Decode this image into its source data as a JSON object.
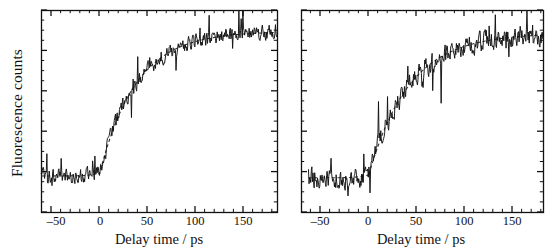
{
  "figure": {
    "title": "",
    "background_color": "#ffffff",
    "ink_color": "#111111",
    "panel_count": 2
  },
  "chart_data": [
    {
      "type": "line",
      "panel": "left",
      "title": "",
      "xlabel": "Delay time / ps",
      "ylabel": "Fluorescence counts",
      "xlim": [
        -65,
        185
      ],
      "ylim": [
        0,
        1.12
      ],
      "xticks": [
        -50,
        0,
        50,
        100,
        150
      ],
      "xticklabels": [
        "–50",
        "0",
        "50",
        "100",
        "150"
      ],
      "xminortick_step": 10,
      "yticklabels": [],
      "yticks_unlabeled": true,
      "grid": false,
      "legend": null,
      "series": [
        {
          "name": "fluorescence rise (data)",
          "style": "solid-noisy",
          "color": "#111111",
          "description": "noisy fluorescence transient: flat baseline before t=0, sigmoidal rise from 0 to ~110 ps, noisy plateau thereafter",
          "noise_amplitude": 0.055,
          "baseline": 0.16,
          "plateau": 0.93,
          "t_zero": 0,
          "rise_time_ps": 38
        },
        {
          "name": "exponential fit",
          "style": "dashed",
          "color": "#222222",
          "description": "smooth single-exponential rise convoluted with instrument response",
          "baseline": 0.16,
          "plateau": 0.93,
          "t_zero": 0,
          "rise_time_ps": 38
        }
      ]
    },
    {
      "type": "line",
      "panel": "right",
      "title": "",
      "xlabel": "Delay time / ps",
      "ylabel": "",
      "xlim": [
        -62,
        185
      ],
      "ylim": [
        0,
        1.12
      ],
      "xticks": [
        -50,
        0,
        50,
        100,
        150
      ],
      "xticklabels": [
        "–50",
        "0",
        "50",
        "100",
        "150"
      ],
      "xminortick_step": 10,
      "yticklabels": [],
      "yticks_unlabeled": true,
      "grid": false,
      "legend": null,
      "series": [
        {
          "name": "fluorescence rise (data)",
          "style": "solid-noisy",
          "color": "#111111",
          "description": "noisy fluorescence transient with larger scatter: flat baseline before t=0, sigmoidal rise to ~110 ps, noisy plateau",
          "noise_amplitude": 0.075,
          "baseline": 0.15,
          "plateau": 0.92,
          "t_zero": 0,
          "rise_time_ps": 42
        },
        {
          "name": "exponential fit",
          "style": "dashed",
          "color": "#222222",
          "description": "smooth single-exponential rise convoluted with instrument response",
          "baseline": 0.15,
          "plateau": 0.92,
          "t_zero": 0,
          "rise_time_ps": 42
        }
      ]
    }
  ],
  "panels": {
    "left": {
      "name": "left-plot",
      "axis_label_x": "Delay time / ps",
      "axis_label_y": "Fluorescence counts",
      "tick_labels_x": [
        "–50",
        "0",
        "50",
        "100",
        "150"
      ]
    },
    "right": {
      "name": "right-plot",
      "axis_label_x": "Delay time / ps",
      "axis_label_y": "",
      "tick_labels_x": [
        "–50",
        "0",
        "50",
        "100",
        "150"
      ]
    }
  }
}
